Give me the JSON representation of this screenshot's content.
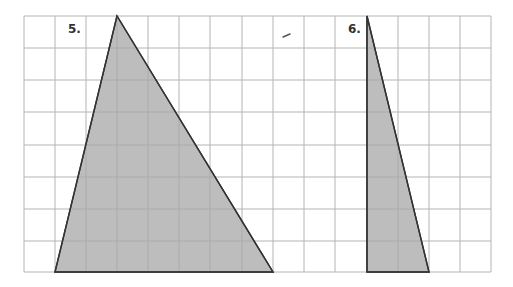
{
  "grid": {
    "columns": 15,
    "rows": 8,
    "x_lines": [
      24,
      55,
      86,
      117,
      148,
      179,
      210,
      242,
      273,
      304,
      335,
      367,
      398,
      429,
      460,
      491
    ],
    "y_lines": [
      16,
      48,
      80,
      112,
      145,
      177,
      209,
      241,
      272
    ],
    "line_color": "#b4b4b4"
  },
  "shapes": [
    {
      "label": "5.",
      "label_pos": [
        68,
        33
      ],
      "type": "triangle",
      "points": [
        [
          117,
          16
        ],
        [
          55,
          272
        ],
        [
          273,
          272
        ]
      ],
      "grid_points": [
        [
          3,
          0
        ],
        [
          1,
          8
        ],
        [
          8,
          8
        ]
      ],
      "fill": "#bdbdbd",
      "stroke": "#333333"
    },
    {
      "label": "6.",
      "label_pos": [
        348,
        33
      ],
      "type": "triangle",
      "points": [
        [
          367,
          16
        ],
        [
          367,
          272
        ],
        [
          429,
          272
        ]
      ],
      "grid_points": [
        [
          11,
          0
        ],
        [
          11,
          8
        ],
        [
          13,
          8
        ]
      ],
      "fill": "#bdbdbd",
      "stroke": "#333333"
    }
  ],
  "mark": {
    "points": [
      [
        283,
        37
      ],
      [
        290,
        34
      ]
    ],
    "color": "#555555"
  }
}
